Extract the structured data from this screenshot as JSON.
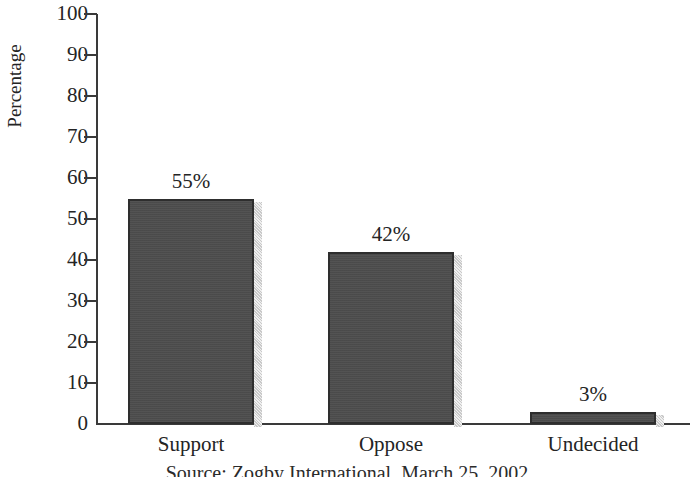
{
  "chart_data": {
    "type": "bar",
    "title": "",
    "subtitle": "",
    "xlabel": "",
    "ylabel": "Percentage",
    "categories": [
      "Support",
      "Oppose",
      "Undecided"
    ],
    "values": [
      55,
      42,
      3
    ],
    "value_labels": [
      "55%",
      "42%",
      "3%"
    ],
    "ylim": [
      0,
      100
    ],
    "ytick_step": 10,
    "yticks": [
      100,
      90,
      80,
      70,
      60,
      50,
      40,
      30,
      20,
      10,
      0
    ],
    "ytick_labels": [
      "100",
      "90",
      "80",
      "70",
      "60",
      "50",
      "40",
      "30",
      "20",
      "10",
      "0"
    ],
    "grid": false,
    "legend": false,
    "legend_position": "none",
    "series": [
      {
        "name": "Percentage",
        "values": [
          55,
          42,
          3
        ]
      }
    ],
    "annotations": [
      {
        "name": "source-note",
        "text": "Source: Zogby International, March 25, 2002"
      }
    ],
    "colors": {
      "bar_fill": "#4d4d4d",
      "bar_border": "#2e2e2e",
      "bar_shadow": "#c9c9c9",
      "axis": "#3a3a3a",
      "text": "#242424",
      "background": "#ffffff"
    }
  },
  "caption": {
    "source_text": "Source: Zogby International, March 25, 2002"
  }
}
